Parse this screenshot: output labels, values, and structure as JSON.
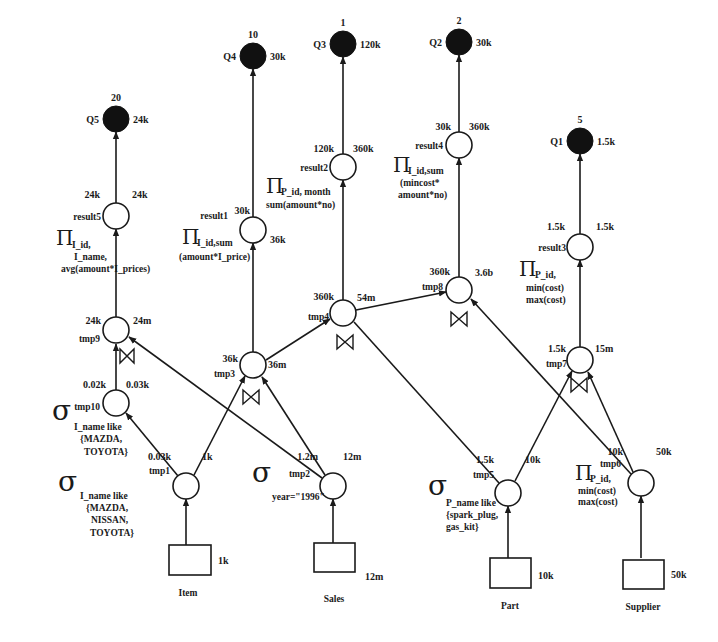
{
  "diagram": {
    "queries": [
      {
        "id": "Q5",
        "label": "Q5",
        "weight": "20",
        "size": "24k"
      },
      {
        "id": "Q4",
        "label": "Q4",
        "weight": "10",
        "size": "30k"
      },
      {
        "id": "Q3",
        "label": "Q3",
        "weight": "1",
        "size": "120k"
      },
      {
        "id": "Q2",
        "label": "Q2",
        "weight": "2",
        "size": "30k"
      },
      {
        "id": "Q1",
        "label": "Q1",
        "weight": "5",
        "size": "1.5k"
      }
    ],
    "nodes": {
      "result5": {
        "name": "result5",
        "left": "24k",
        "right": "24k",
        "op": "Π",
        "op_sub": "I_id,",
        "op_lines": [
          "I_name,",
          "avg(amount*I_prices)"
        ]
      },
      "result1": {
        "name": "result1",
        "left": "30k",
        "right": "36k",
        "op": "Π",
        "op_sub": "I_id,sum",
        "op_lines": [
          "(amount*I_price)"
        ]
      },
      "result2": {
        "name": "result2",
        "left": "120k",
        "right": "360k",
        "op": "Π",
        "op_sub": "P_id, month",
        "op_lines": [
          "sum(amount*no)"
        ]
      },
      "result4": {
        "name": "result4",
        "left": "30k",
        "right": "360k",
        "op": "Π",
        "op_sub": "I_id,sum",
        "op_lines": [
          "(mincost*",
          "amount*no)"
        ]
      },
      "result3": {
        "name": "result3",
        "left": "1.5k",
        "right": "1.5k",
        "op": "Π",
        "op_sub": "P_id,",
        "op_lines": [
          "min(cost)",
          "max(cost)"
        ]
      },
      "tmp9": {
        "name": "tmp9",
        "left": "24k",
        "right": "24m"
      },
      "tmp3": {
        "name": "tmp3",
        "left": "36k",
        "right": "36m"
      },
      "tmp4": {
        "name": "tmp4",
        "left": "360k",
        "right": "54m"
      },
      "tmp8": {
        "name": "tmp8",
        "left": "360k",
        "right": "3.6b"
      },
      "tmp7": {
        "name": "tmp7",
        "left": "1.5k",
        "right": "15m"
      },
      "tmp10": {
        "name": "tmp10",
        "left": "0.02k",
        "right": "0.03k",
        "op": "σ",
        "op_lines": [
          "I_name like",
          "{MAZDA,",
          "TOYOTA}"
        ]
      },
      "tmp1": {
        "name": "tmp1",
        "left": "0.03k",
        "right": "1k",
        "op": "σ",
        "op_lines": [
          "I_name like",
          "{MAZDA,",
          "NISSAN,",
          "TOYOTA}"
        ]
      },
      "tmp2": {
        "name": "tmp2",
        "left": "1.2m",
        "right": "12m",
        "op": "σ",
        "op_lines": [
          "year=\"1996\""
        ]
      },
      "tmp5": {
        "name": "tmp5",
        "left": "1.5k",
        "right": "10k",
        "op": "σ",
        "op_lines": [
          "P_name like",
          "{spark_plug,",
          "gas_kit}"
        ]
      },
      "tmp6": {
        "name": "tmp6",
        "left": "10k",
        "right": "50k",
        "op": "Π",
        "op_sub": "P_id,",
        "op_lines": [
          "min(cost)",
          "max(cost)"
        ]
      }
    },
    "join_symbol": "⋈",
    "relations": [
      {
        "name": "Item",
        "size": "1k"
      },
      {
        "name": "Sales",
        "size": "12m"
      },
      {
        "name": "Part",
        "size": "10k"
      },
      {
        "name": "Supplier",
        "size": "50k"
      }
    ]
  }
}
